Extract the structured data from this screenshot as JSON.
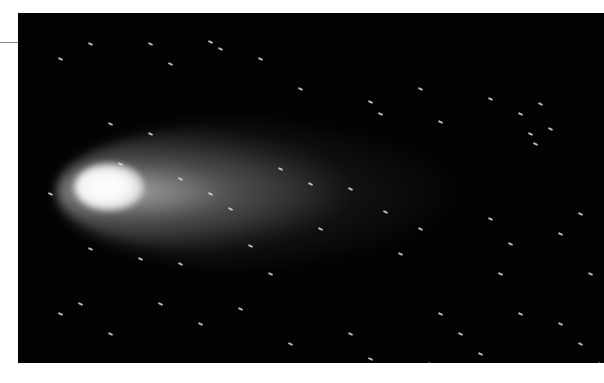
{
  "image": {
    "subject": "comet-photograph",
    "description": "Long-exposure photograph of a comet with a bright white coma at left and a diffuse gray tail extending to the right, against a black star field with short trailed stars.",
    "colors": {
      "background": "#ffffff",
      "sky": "#030303",
      "coma": "#ffffff",
      "tail": "#8c8c8c",
      "stars": "#d8d8d8",
      "leader_line": "#888888"
    }
  },
  "stars": [
    [
      40,
      45
    ],
    [
      70,
      30
    ],
    [
      130,
      30
    ],
    [
      190,
      28
    ],
    [
      200,
      35
    ],
    [
      150,
      50
    ],
    [
      240,
      45
    ],
    [
      280,
      75
    ],
    [
      350,
      88
    ],
    [
      360,
      100
    ],
    [
      400,
      75
    ],
    [
      420,
      108
    ],
    [
      470,
      85
    ],
    [
      500,
      100
    ],
    [
      520,
      90
    ],
    [
      510,
      120
    ],
    [
      515,
      130
    ],
    [
      530,
      115
    ],
    [
      130,
      120
    ],
    [
      90,
      110
    ],
    [
      160,
      165
    ],
    [
      190,
      180
    ],
    [
      210,
      195
    ],
    [
      260,
      155
    ],
    [
      290,
      170
    ],
    [
      330,
      175
    ],
    [
      365,
      198
    ],
    [
      300,
      215
    ],
    [
      230,
      232
    ],
    [
      160,
      250
    ],
    [
      120,
      245
    ],
    [
      70,
      235
    ],
    [
      60,
      290
    ],
    [
      90,
      320
    ],
    [
      180,
      310
    ],
    [
      220,
      295
    ],
    [
      270,
      330
    ],
    [
      330,
      320
    ],
    [
      420,
      300
    ],
    [
      440,
      320
    ],
    [
      460,
      340
    ],
    [
      500,
      300
    ],
    [
      540,
      310
    ],
    [
      560,
      330
    ],
    [
      470,
      205
    ],
    [
      490,
      230
    ],
    [
      540,
      220
    ],
    [
      560,
      200
    ],
    [
      400,
      215
    ],
    [
      380,
      240
    ],
    [
      100,
      150
    ],
    [
      30,
      180
    ],
    [
      40,
      300
    ],
    [
      350,
      345
    ],
    [
      410,
      350
    ],
    [
      580,
      350
    ],
    [
      570,
      260
    ],
    [
      480,
      260
    ],
    [
      250,
      260
    ],
    [
      140,
      290
    ]
  ],
  "caption": ""
}
